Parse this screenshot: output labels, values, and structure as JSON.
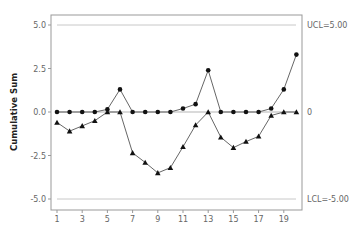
{
  "chart_data": {
    "type": "line",
    "title": "",
    "xlabel": "",
    "ylabel": "Cumulative Sum",
    "x": [
      1,
      2,
      3,
      4,
      5,
      6,
      7,
      8,
      9,
      10,
      11,
      12,
      13,
      14,
      15,
      16,
      17,
      18,
      19,
      20
    ],
    "x_ticks": [
      1,
      3,
      5,
      7,
      9,
      11,
      13,
      15,
      17,
      19
    ],
    "y_ticks": [
      5.0,
      2.5,
      0.0,
      -2.5,
      -5.0
    ],
    "y_tick_labels": [
      "5.0",
      "2.5",
      "0.0",
      "-2.5",
      "-5.0"
    ],
    "ylim": [
      -5.6,
      5.6
    ],
    "xlim": [
      0.5,
      20.5
    ],
    "grid": false,
    "series": [
      {
        "name": "Upper CUSUM",
        "marker": "circle",
        "values": [
          0,
          0,
          0,
          0,
          0.15,
          1.3,
          0,
          0,
          0,
          0,
          0.2,
          0.45,
          2.4,
          0,
          0,
          0,
          0,
          0.2,
          1.3,
          3.3
        ]
      },
      {
        "name": "Lower CUSUM",
        "marker": "triangle",
        "values": [
          -0.6,
          -1.1,
          -0.8,
          -0.5,
          0,
          0,
          -2.35,
          -2.9,
          -3.5,
          -3.2,
          -2.0,
          -0.75,
          0,
          -1.45,
          -2.05,
          -1.7,
          -1.4,
          -0.2,
          0,
          0
        ]
      }
    ],
    "reference_lines": [
      {
        "name": "UCL",
        "value": 5.0,
        "label": "UCL=5.00"
      },
      {
        "name": "Center",
        "value": 0,
        "label": "0"
      },
      {
        "name": "LCL",
        "value": -5.0,
        "label": "LCL=-5.00"
      }
    ]
  }
}
